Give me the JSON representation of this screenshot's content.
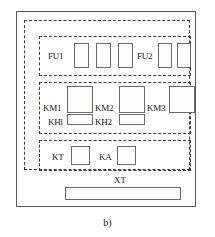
{
  "figure": {
    "caption": "b)",
    "cabinet": {
      "name": "control-cabinet-outline"
    },
    "groups": [
      {
        "id": "fuse-group",
        "label": "fuse-row"
      },
      {
        "id": "contactor-group",
        "label": "contactor-row"
      },
      {
        "id": "relay-group",
        "label": "timer-relay-row"
      }
    ],
    "components": [
      {
        "tag": "FU1",
        "type": "fuse",
        "count": 1
      },
      {
        "tag": "FU2",
        "type": "fuse",
        "count": 1
      },
      {
        "tag": "KM1",
        "type": "contactor",
        "count": 1
      },
      {
        "tag": "KM2",
        "type": "contactor",
        "count": 1
      },
      {
        "tag": "KM3",
        "type": "contactor",
        "count": 1
      },
      {
        "tag": "KH1",
        "type": "overload-relay",
        "count": 1
      },
      {
        "tag": "KH2",
        "type": "overload-relay",
        "count": 1
      },
      {
        "tag": "KT",
        "type": "time-relay",
        "count": 1
      },
      {
        "tag": "KA",
        "type": "aux-relay",
        "count": 1
      },
      {
        "tag": "XT",
        "type": "terminal-block",
        "count": 1
      }
    ],
    "labels": {
      "fu1": "FU1",
      "fu2": "FU2",
      "km1": "KM1",
      "km2": "KM2",
      "km3": "KM3",
      "kh1": "KHl",
      "kh2": "KH2",
      "kt": "KT",
      "ka": "KA",
      "xt": "XT"
    },
    "colors": {
      "line": "#5a5a5a",
      "dashed": "#3d3d3d",
      "box": "#6a6a6a",
      "text": "#161616",
      "background": "#ffffff"
    }
  }
}
